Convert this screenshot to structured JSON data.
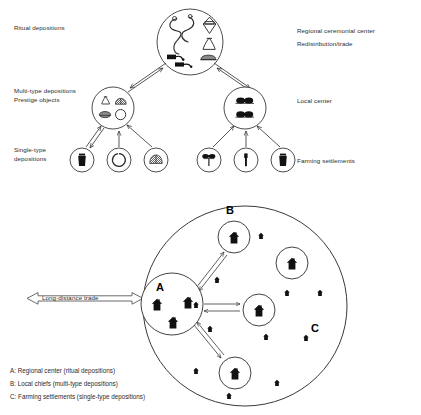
{
  "figure": {
    "top_diagram": {
      "name": "settlement-hierarchy-tree",
      "labels_left": [
        {
          "id": "ritual-depositions",
          "text": "Ritual depositions",
          "x": 14,
          "y": 28
        },
        {
          "id": "multi-type-depositions",
          "text": "Multi-type depositions",
          "x": 14,
          "y": 91
        },
        {
          "id": "prestige-objects",
          "text": "Prestige objects",
          "x": 14,
          "y": 99
        },
        {
          "id": "single-type",
          "text": "Single-type",
          "x": 14,
          "y": 149
        },
        {
          "id": "single-type-depositions",
          "text": "depositions",
          "x": 14,
          "y": 158
        }
      ],
      "labels_right": [
        {
          "id": "regional-ceremonial-center",
          "text": "Regional ceremonial center",
          "x": 297,
          "y": 30
        },
        {
          "id": "redistribution-trade",
          "text": "Redistribution/trade",
          "x": 297,
          "y": 43
        },
        {
          "id": "local-center",
          "text": "Local center",
          "x": 297,
          "y": 96
        },
        {
          "id": "farming-settlements",
          "text": "Farming settlements",
          "x": 297,
          "y": 159
        }
      ],
      "nodes": {
        "regional_center": {
          "id": "regional-center-node",
          "cx": 190,
          "cy": 42,
          "r": 33,
          "contents": [
            "torc",
            "torc",
            "vessel-lozenge",
            "vessel-bell",
            "axe-dark",
            "axe-dark",
            "axe-flat"
          ]
        },
        "local_chiefs_left": {
          "id": "multi-type-node",
          "cx": 113,
          "cy": 108,
          "r": 21,
          "contents": [
            "vessel-bell",
            "hatched-object",
            "dark-oval",
            "ring"
          ]
        },
        "local_chiefs_right": {
          "id": "local-center-node",
          "cx": 245,
          "cy": 108,
          "r": 21,
          "contents": [
            "dark-paired-object",
            "dark-paired-object"
          ]
        },
        "farming": [
          {
            "id": "farming-node-1",
            "cx": 82,
            "cy": 160,
            "r": 12,
            "contents": [
              "dark-vessel"
            ]
          },
          {
            "id": "farming-node-2",
            "cx": 119,
            "cy": 160,
            "r": 12,
            "contents": [
              "ring"
            ]
          },
          {
            "id": "farming-node-3",
            "cx": 156,
            "cy": 160,
            "r": 12,
            "contents": [
              "hatched-object"
            ]
          },
          {
            "id": "farming-node-4",
            "cx": 209,
            "cy": 160,
            "r": 12,
            "contents": [
              "pin-t-shape"
            ]
          },
          {
            "id": "farming-node-5",
            "cx": 246,
            "cy": 160,
            "r": 12,
            "contents": [
              "pin-vertical"
            ]
          },
          {
            "id": "farming-node-6",
            "cx": 283,
            "cy": 160,
            "r": 12,
            "contents": [
              "dark-vessel"
            ]
          }
        ]
      }
    },
    "bottom_diagram": {
      "name": "territory-map",
      "territory_circle": {
        "cx": 245,
        "cy": 306,
        "rx": 102,
        "ry": 100
      },
      "trade_arrow_label": {
        "id": "long-distance-trade",
        "text": "Long-distance trade",
        "x": 42,
        "y": 295
      },
      "letters": [
        {
          "id": "letter-A",
          "text": "A",
          "x": 160,
          "y": 288
        },
        {
          "id": "letter-B",
          "text": "B",
          "x": 228,
          "y": 210
        },
        {
          "id": "letter-C",
          "text": "C",
          "x": 313,
          "y": 328
        }
      ],
      "regional_center_cluster": {
        "cx": 172,
        "cy": 304,
        "r": 31,
        "houses": 3
      },
      "local_chief_sites": [
        {
          "id": "chief-site-north",
          "cx": 234,
          "cy": 237,
          "r": 16
        },
        {
          "id": "chief-site-east",
          "cx": 292,
          "cy": 263,
          "r": 16
        },
        {
          "id": "chief-site-center",
          "cx": 259,
          "cy": 310,
          "r": 16
        },
        {
          "id": "chief-site-south",
          "cx": 235,
          "cy": 373,
          "r": 16
        }
      ],
      "farm_sites": [
        {
          "cx": 261,
          "cy": 236
        },
        {
          "cx": 217,
          "cy": 280
        },
        {
          "cx": 287,
          "cy": 293
        },
        {
          "cx": 320,
          "cy": 293
        },
        {
          "cx": 210,
          "cy": 329
        },
        {
          "cx": 196,
          "cy": 305
        },
        {
          "cx": 266,
          "cy": 337
        },
        {
          "cx": 306,
          "cy": 338
        },
        {
          "cx": 196,
          "cy": 371
        },
        {
          "cx": 277,
          "cy": 383
        },
        {
          "cx": 229,
          "cy": 396
        }
      ],
      "legend": [
        {
          "id": "legend-a",
          "text": "A: Regional center (ritual depositions)"
        },
        {
          "id": "legend-b",
          "text": "B: Local chiefs (multi-type depositions)"
        },
        {
          "id": "legend-c",
          "text": "C: Farming settlements (single-type depositions)"
        }
      ]
    },
    "colors": {
      "stroke": "#3a3a3a",
      "fill_dark": "#111111",
      "text": "#2b2b2b",
      "background": "#ffffff"
    }
  }
}
